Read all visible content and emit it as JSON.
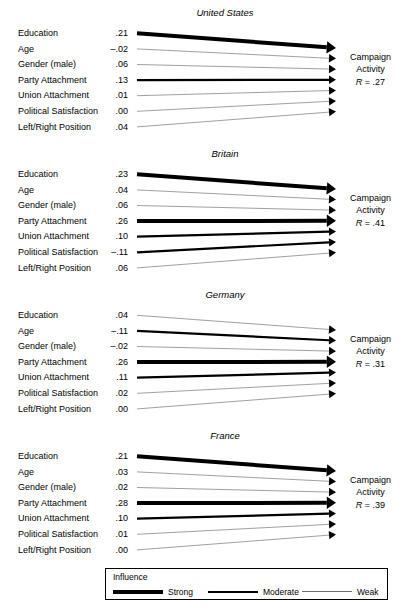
{
  "figure": {
    "outcome_label_line1": "Campaign",
    "outcome_label_line2": "Activity",
    "r_symbol": "R",
    "row_labels": [
      "Education",
      "Age",
      "Gender (male)",
      "Party Attachment",
      "Union Attachment",
      "Political Satisfaction",
      "Left/Right Position"
    ]
  },
  "legend": {
    "title": "Influence",
    "items": [
      {
        "label": "Strong",
        "weight": "strong"
      },
      {
        "label": "Moderate",
        "weight": "moderate"
      },
      {
        "label": "Weak",
        "weight": "weak"
      }
    ]
  },
  "chart_data": {
    "type": "diagram",
    "xlabel": "",
    "ylabel": "",
    "categories": [
      "Education",
      "Age",
      "Gender (male)",
      "Party Attachment",
      "Union Attachment",
      "Political Satisfaction",
      "Left/Right Position"
    ],
    "legend_position": "bottom",
    "grid": false,
    "panels": [
      {
        "name": "United States",
        "outcome": "Campaign Activity",
        "r_label": "R = .27",
        "r_value": 0.27,
        "values": [
          ".21",
          "–.02",
          ".06",
          ".13",
          ".01",
          ".00",
          ".04"
        ],
        "numeric_values": [
          0.21,
          -0.02,
          0.06,
          0.13,
          0.01,
          0.0,
          0.04
        ],
        "weights": [
          "strong",
          "weak",
          "weak",
          "moderate",
          "weak",
          "weak",
          "weak"
        ]
      },
      {
        "name": "Britain",
        "outcome": "Campaign Activity",
        "r_label": "R = .41",
        "r_value": 0.41,
        "values": [
          ".23",
          ".04",
          ".06",
          ".26",
          ".10",
          "–.11",
          ".06"
        ],
        "numeric_values": [
          0.23,
          0.04,
          0.06,
          0.26,
          0.1,
          -0.11,
          0.06
        ],
        "weights": [
          "strong",
          "weak",
          "weak",
          "strong",
          "moderate",
          "moderate",
          "weak"
        ]
      },
      {
        "name": "Germany",
        "outcome": "Campaign Activity",
        "r_label": "R = .31",
        "r_value": 0.31,
        "values": [
          ".04",
          "–.11",
          "–.02",
          ".26",
          ".11",
          ".02",
          ".00"
        ],
        "numeric_values": [
          0.04,
          -0.11,
          -0.02,
          0.26,
          0.11,
          0.02,
          0.0
        ],
        "weights": [
          "weak",
          "moderate",
          "weak",
          "strong",
          "moderate",
          "weak",
          "weak"
        ]
      },
      {
        "name": "France",
        "outcome": "Campaign Activity",
        "r_label": "R = .39",
        "r_value": 0.39,
        "values": [
          ".21",
          ".03",
          ".02",
          ".28",
          ".10",
          ".01",
          ".00"
        ],
        "numeric_values": [
          0.21,
          0.03,
          0.02,
          0.28,
          0.1,
          0.01,
          0.0
        ],
        "weights": [
          "strong",
          "weak",
          "weak",
          "strong",
          "moderate",
          "weak",
          "weak"
        ]
      }
    ]
  }
}
